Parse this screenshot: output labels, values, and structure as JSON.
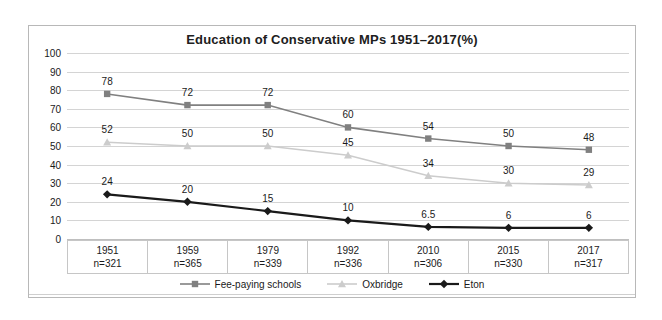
{
  "chart_data": {
    "type": "line",
    "title": "Education of Conservative MPs 1951–2017(%)",
    "xlabel": "",
    "ylabel": "",
    "ylim": [
      0,
      100
    ],
    "yticks": [
      100,
      90,
      80,
      70,
      60,
      50,
      40,
      30,
      20,
      10,
      0
    ],
    "grid": true,
    "legend_position": "bottom",
    "categories": [
      "1951",
      "1959",
      "1979",
      "1992",
      "2010",
      "2015",
      "2017"
    ],
    "category_sublabels": [
      "n=321",
      "n=365",
      "n=339",
      "n=336",
      "n=306",
      "n=330",
      "n=317"
    ],
    "series": [
      {
        "name": "Fee-paying schools",
        "color": "#808080",
        "marker": "square",
        "values": [
          78,
          72,
          72,
          60,
          54,
          50,
          48
        ],
        "labels": [
          "78",
          "72",
          "72",
          "60",
          "54",
          "50",
          "48"
        ]
      },
      {
        "name": "Oxbridge",
        "color": "#cccccc",
        "marker": "triangle",
        "values": [
          52,
          50,
          50,
          45,
          34,
          30,
          29
        ],
        "labels": [
          "52",
          "50",
          "50",
          "45",
          "34",
          "30",
          "29"
        ]
      },
      {
        "name": "Eton",
        "color": "#1a1a1a",
        "marker": "diamond",
        "values": [
          24,
          20,
          15,
          10,
          6.5,
          6,
          6
        ],
        "labels": [
          "24",
          "20",
          "15",
          "10",
          "6.5",
          "6",
          "6"
        ]
      }
    ]
  },
  "colors": {
    "frame_border": "#b8b8b8",
    "gridline": "#d4d4d4",
    "text": "#1a1a1a"
  }
}
